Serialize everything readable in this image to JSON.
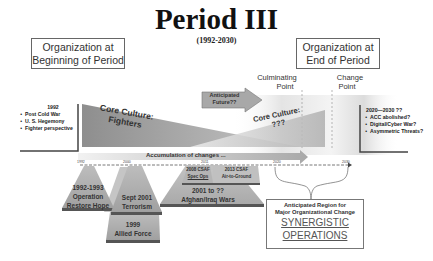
{
  "title": "Period III",
  "subtitle": "(1992-2030)",
  "org_begin": {
    "line1": "Organization at",
    "line2": "Beginning of Period"
  },
  "org_end": {
    "line1": "Organization at",
    "line2": "End of Period"
  },
  "culminating_point": {
    "line1": "Culminating",
    "line2": "Point"
  },
  "change_point": {
    "line1": "Change",
    "line2": "Point"
  },
  "left_context": {
    "year": "1992",
    "bullets": [
      "Post Cold War",
      "U. S. Hegemony",
      "Fighter perspective"
    ]
  },
  "right_context": {
    "year": "2020—2030 ??",
    "bullets": [
      "ACC abolished?",
      "Digital/Cyber War?",
      "Asymmetric Threats?"
    ]
  },
  "core_culture_left": {
    "line1": "Core Culture:",
    "line2": "Fighters"
  },
  "core_culture_right": {
    "line1": "Core Culture:",
    "line2": "???"
  },
  "anticipated_future": {
    "line1": "Anticipated",
    "line2": "Future??"
  },
  "accumulation_label": "Accumulation of changes ...",
  "timeline": {
    "ticks": [
      "1992",
      "2000",
      "2011",
      "2020",
      "2030"
    ]
  },
  "events": [
    {
      "line1": "1992-1993",
      "line2": "Operation",
      "line3": "Restore Hope"
    },
    {
      "line1": "1999",
      "line2": "Allied Force"
    },
    {
      "line1": "Sept 2001",
      "line2": "Terrorism"
    },
    {
      "line1": "2001 to ??",
      "line2": "Afghan/Iraq Wars"
    },
    {
      "line1": "2008 CSAF",
      "line2": "Spec Ops"
    },
    {
      "line1": "2013 CSAF",
      "line2": "Air-to-Ground"
    }
  ],
  "anticipated_region": {
    "line1": "Anticipated Region for",
    "line2": "Major Organizational Change",
    "syn1": "SYNERGISTIC",
    "syn2": "OPERATIONS"
  },
  "colors": {
    "shape_gray": "#9a9a9a",
    "arrow_fill": "#a8a8a8",
    "box_border": "#666666"
  }
}
